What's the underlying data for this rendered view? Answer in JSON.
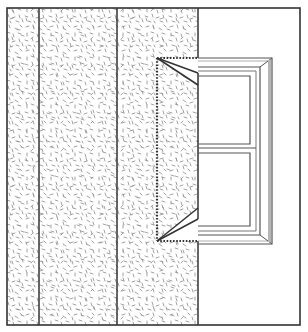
{
  "figure": {
    "title": "Wall section with window opening and splayed reveal",
    "components": [
      {
        "name": "outer-border",
        "label": "Drawing border"
      },
      {
        "name": "wall-layer-1",
        "label": "Wall layer (narrow)"
      },
      {
        "name": "wall-layer-2",
        "label": "Wall layer (wide)"
      },
      {
        "name": "wall-layer-3",
        "label": "Wall layer (reveal zone)"
      },
      {
        "name": "splay-top",
        "label": "Splayed reveal (top)"
      },
      {
        "name": "splay-bottom",
        "label": "Splayed reveal (bottom)"
      },
      {
        "name": "dotted-guide",
        "label": "Dotted guide outline"
      },
      {
        "name": "window-frame",
        "label": "Window frame"
      },
      {
        "name": "window-sash-upper",
        "label": "Upper sash pane"
      },
      {
        "name": "window-sash-lower",
        "label": "Lower sash pane"
      }
    ],
    "colors": {
      "line": "#333333",
      "texture": "#8a8a8a",
      "frame_bevel": "#b5b5b5",
      "background": "#ffffff"
    }
  }
}
